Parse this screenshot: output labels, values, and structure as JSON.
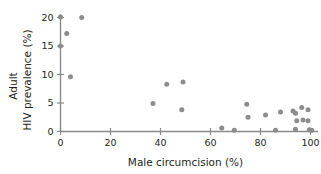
{
  "chart_data": {
    "type": "scatter",
    "title": "",
    "xlabel": "Male circumcision (%)",
    "ylabel_line1": "Adult",
    "ylabel_line2": "HIV prevalence (%)",
    "xlim": [
      0,
      104
    ],
    "ylim": [
      0,
      21
    ],
    "xticks": [
      0,
      20,
      40,
      60,
      80,
      100
    ],
    "xticklabels": [
      "0",
      "20",
      "40",
      "60",
      "80",
      "100"
    ],
    "yticks": [
      0,
      5,
      10,
      15,
      20
    ],
    "yticklabels": [
      "0",
      "5",
      "10",
      "15",
      "20"
    ],
    "grid": false,
    "legend": false,
    "marker_color": "#8c8c8c",
    "axis_color": "#8a8a8a",
    "points": [
      {
        "x": 0.0,
        "y": 20.1
      },
      {
        "x": 8.5,
        "y": 20.0
      },
      {
        "x": 2.5,
        "y": 17.2
      },
      {
        "x": 0.0,
        "y": 15.0
      },
      {
        "x": 4.0,
        "y": 9.6
      },
      {
        "x": 37.0,
        "y": 4.9
      },
      {
        "x": 42.5,
        "y": 8.3
      },
      {
        "x": 49.0,
        "y": 8.7
      },
      {
        "x": 48.5,
        "y": 3.8
      },
      {
        "x": 64.5,
        "y": 0.6
      },
      {
        "x": 69.5,
        "y": 0.2
      },
      {
        "x": 74.5,
        "y": 4.8
      },
      {
        "x": 75.0,
        "y": 2.5
      },
      {
        "x": 82.0,
        "y": 2.9
      },
      {
        "x": 86.0,
        "y": 0.2
      },
      {
        "x": 88.0,
        "y": 3.4
      },
      {
        "x": 93.0,
        "y": 3.6
      },
      {
        "x": 94.0,
        "y": 3.2
      },
      {
        "x": 94.5,
        "y": 1.9
      },
      {
        "x": 94.0,
        "y": 0.4
      },
      {
        "x": 96.5,
        "y": 4.2
      },
      {
        "x": 97.0,
        "y": 2.0
      },
      {
        "x": 99.0,
        "y": 3.8
      },
      {
        "x": 99.0,
        "y": 1.9
      },
      {
        "x": 99.5,
        "y": 0.3
      },
      {
        "x": 100.5,
        "y": 0.2
      }
    ]
  }
}
